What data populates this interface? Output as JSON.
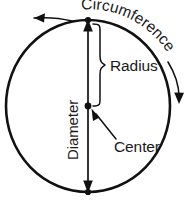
{
  "figure": {
    "name": "circle-parts-diagram",
    "background_color": "#ffffff",
    "stroke_color": "#111111",
    "text_color": "#1a1a1a"
  },
  "labels": {
    "circumference": "Circumference",
    "radius": "Radius",
    "diameter": "Diameter",
    "center": "Center"
  },
  "geometry": {
    "circle": {
      "center_x": 88,
      "center_y": 106,
      "radius": 83,
      "stroke_width": 2.6
    },
    "diameter_line": {
      "x": 88,
      "y_top": 20,
      "y_bottom": 192,
      "length": 172,
      "arrowheads": "both"
    },
    "points": [
      {
        "name": "top-point",
        "x": 88,
        "y": 20
      },
      {
        "name": "center-point",
        "x": 88,
        "y": 106
      },
      {
        "name": "bottom-point",
        "x": 88,
        "y": 192
      }
    ],
    "radius_brace": {
      "x": 100,
      "y_top": 24,
      "y_bottom": 108
    }
  },
  "annotations": {
    "circumference_arrow_left": "arrow pointing counterclockwise along arc",
    "circumference_arrow_right": "arrow pointing clockwise along arc",
    "center_pointer": "arrow from Center label to center point",
    "radius_brace": "curly brace from top of circle to center"
  }
}
